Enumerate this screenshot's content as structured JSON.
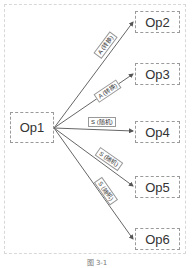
{
  "diagram": {
    "source_node": {
      "label": "Op1"
    },
    "target_nodes": [
      {
        "label": "Op2"
      },
      {
        "label": "Op3"
      },
      {
        "label": "Op4"
      },
      {
        "label": "Op5"
      },
      {
        "label": "Op6"
      }
    ],
    "edges": [
      {
        "from": "Op1",
        "to": "Op2",
        "label": "A (转换)"
      },
      {
        "from": "Op1",
        "to": "Op3",
        "label": "A (转换)"
      },
      {
        "from": "Op1",
        "to": "Op4",
        "label": "S (随机)"
      },
      {
        "from": "Op1",
        "to": "Op5",
        "label": "S (随机)"
      },
      {
        "from": "Op1",
        "to": "Op6",
        "label": "S (随机)"
      }
    ],
    "caption": "图 3-1"
  }
}
